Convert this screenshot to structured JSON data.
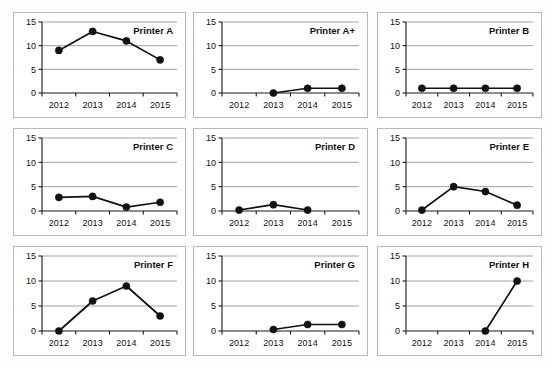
{
  "figure": {
    "layout": "3x3 small multiples",
    "rows": 3,
    "cols": 3,
    "background_color": "#fdfdfd",
    "panel_border_color": "#b9b9b9",
    "series_color": "#111111",
    "grid_color": "#8a8a8a"
  },
  "chart_data": [
    {
      "type": "line",
      "title": "Printer A",
      "categories": [
        "2012",
        "2013",
        "2014",
        "2015"
      ],
      "values": [
        9,
        13,
        11,
        7
      ],
      "xlabel": "",
      "ylabel": "",
      "ylim": [
        0,
        15
      ],
      "yticks": [
        0,
        5,
        10,
        15
      ],
      "grid": true,
      "legend": "none"
    },
    {
      "type": "line",
      "title": "Printer A+",
      "categories": [
        "2012",
        "2013",
        "2014",
        "2015"
      ],
      "values": [
        null,
        0,
        1,
        1
      ],
      "xlabel": "",
      "ylabel": "",
      "ylim": [
        0,
        15
      ],
      "yticks": [
        0,
        5,
        10,
        15
      ],
      "grid": true,
      "legend": "none"
    },
    {
      "type": "line",
      "title": "Printer B",
      "categories": [
        "2012",
        "2013",
        "2014",
        "2015"
      ],
      "values": [
        1,
        1,
        1,
        1
      ],
      "xlabel": "",
      "ylabel": "",
      "ylim": [
        0,
        15
      ],
      "yticks": [
        0,
        5,
        10,
        15
      ],
      "grid": true,
      "legend": "none"
    },
    {
      "type": "line",
      "title": "Printer C",
      "categories": [
        "2012",
        "2013",
        "2014",
        "2015"
      ],
      "values": [
        2.8,
        3,
        0.8,
        1.8
      ],
      "xlabel": "",
      "ylabel": "",
      "ylim": [
        0,
        15
      ],
      "yticks": [
        0,
        5,
        10,
        15
      ],
      "grid": true,
      "legend": "none"
    },
    {
      "type": "line",
      "title": "Printer D",
      "categories": [
        "2012",
        "2013",
        "2014",
        "2015"
      ],
      "values": [
        0.2,
        1.3,
        0.2,
        null
      ],
      "xlabel": "",
      "ylabel": "",
      "ylim": [
        0,
        15
      ],
      "yticks": [
        0,
        5,
        10,
        15
      ],
      "grid": true,
      "legend": "none"
    },
    {
      "type": "line",
      "title": "Printer E",
      "categories": [
        "2012",
        "2013",
        "2014",
        "2015"
      ],
      "values": [
        0.2,
        5,
        4,
        1.2
      ],
      "xlabel": "",
      "ylabel": "",
      "ylim": [
        0,
        15
      ],
      "yticks": [
        0,
        5,
        10,
        15
      ],
      "grid": true,
      "legend": "none"
    },
    {
      "type": "line",
      "title": "Printer F",
      "categories": [
        "2012",
        "2013",
        "2014",
        "2015"
      ],
      "values": [
        0,
        6,
        9,
        3
      ],
      "xlabel": "",
      "ylabel": "",
      "ylim": [
        0,
        15
      ],
      "yticks": [
        0,
        5,
        10,
        15
      ],
      "grid": true,
      "legend": "none"
    },
    {
      "type": "line",
      "title": "Printer G",
      "categories": [
        "2012",
        "2013",
        "2014",
        "2015"
      ],
      "values": [
        null,
        0.3,
        1.3,
        1.3
      ],
      "xlabel": "",
      "ylabel": "",
      "ylim": [
        0,
        15
      ],
      "yticks": [
        0,
        5,
        10,
        15
      ],
      "grid": true,
      "legend": "none"
    },
    {
      "type": "line",
      "title": "Printer H",
      "categories": [
        "2012",
        "2013",
        "2014",
        "2015"
      ],
      "values": [
        null,
        null,
        0,
        10
      ],
      "xlabel": "",
      "ylabel": "",
      "ylim": [
        0,
        15
      ],
      "yticks": [
        0,
        5,
        10,
        15
      ],
      "grid": true,
      "legend": "none"
    }
  ]
}
